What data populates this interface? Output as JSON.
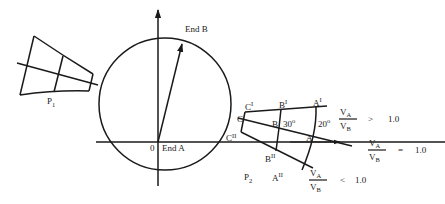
{
  "diagram": {
    "type": "velocity-ratio-circle-construction",
    "circle": {
      "end_a_label": "End A",
      "origin_label": "0",
      "end_b_label": "End B"
    },
    "panel_p1": {
      "label_main": "P",
      "label_sub": "1"
    },
    "panel_p2": {
      "label_main": "P",
      "label_sub": "2",
      "points": {
        "c_prime": {
          "main": "C",
          "sup": "I"
        },
        "b_prime": {
          "main": "B",
          "sup": "I"
        },
        "a_prime": {
          "main": "A",
          "sup": "I"
        },
        "c": {
          "main": "C",
          "sup": ""
        },
        "b": {
          "main": "B",
          "sup": ""
        },
        "a": {
          "main": "A",
          "sup": ""
        },
        "c_double": {
          "main": "C",
          "sup": "II"
        },
        "b_double": {
          "main": "B",
          "sup": "II"
        },
        "a_double": {
          "main": "A",
          "sup": "II"
        }
      },
      "angles": {
        "angle_b": "30",
        "angle_a": "20",
        "degree_mark": "o"
      }
    },
    "ratios": [
      {
        "numerator_main": "V",
        "numerator_sub": "A",
        "denominator_main": "V",
        "denominator_sub": "B",
        "relation": ">",
        "value": "1.0"
      },
      {
        "numerator_main": "V",
        "numerator_sub": "A",
        "denominator_main": "V",
        "denominator_sub": "B",
        "relation": "=",
        "value": "1.0"
      },
      {
        "numerator_main": "V",
        "numerator_sub": "A",
        "denominator_main": "V",
        "denominator_sub": "B",
        "relation": "<",
        "value": "1.0"
      }
    ]
  }
}
